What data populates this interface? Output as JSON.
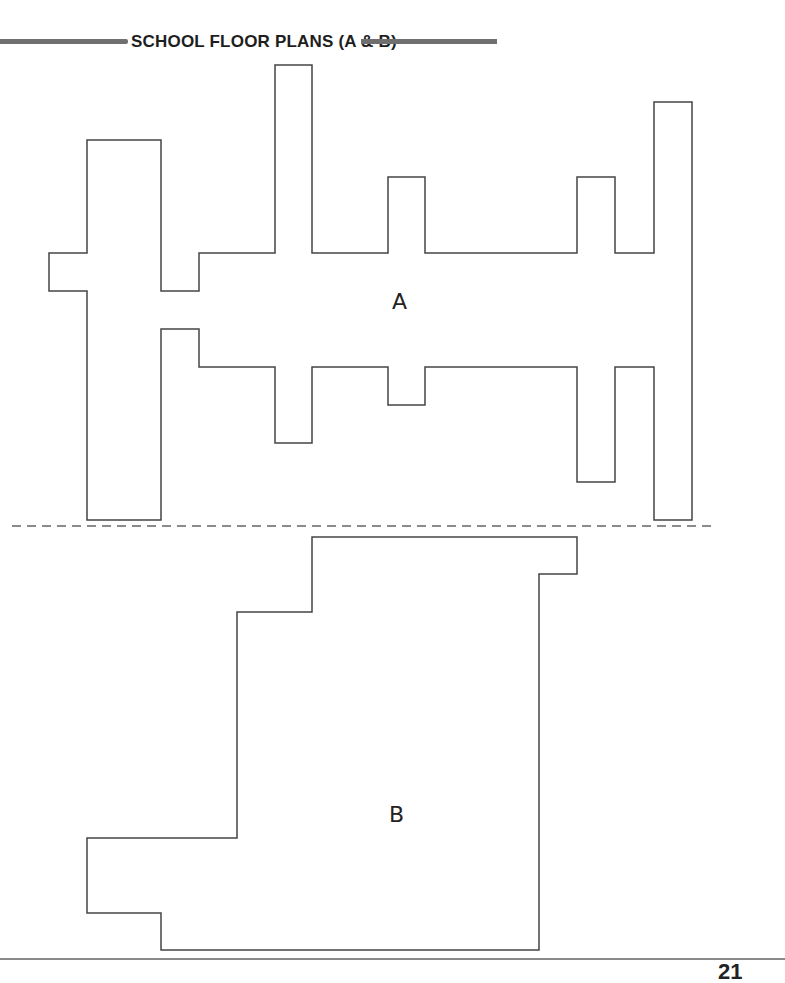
{
  "page": {
    "title": "SCHOOL FLOOR PLANS (A & B)",
    "page_number": "21"
  },
  "colors": {
    "outline": "#444444",
    "header_rule": "#6f6f6f",
    "divider": "#666666",
    "background": "#ffffff"
  },
  "plans": [
    {
      "label": "A",
      "label_position": [
        392,
        291
      ],
      "outline_points": [
        [
          49,
          253
        ],
        [
          87,
          253
        ],
        [
          87,
          140
        ],
        [
          161,
          140
        ],
        [
          161,
          291
        ],
        [
          199,
          291
        ],
        [
          199,
          253
        ],
        [
          275,
          253
        ],
        [
          275,
          65
        ],
        [
          312,
          65
        ],
        [
          312,
          253
        ],
        [
          388,
          253
        ],
        [
          388,
          177
        ],
        [
          425,
          177
        ],
        [
          425,
          253
        ],
        [
          577,
          253
        ],
        [
          577,
          177
        ],
        [
          615,
          177
        ],
        [
          615,
          253
        ],
        [
          654,
          253
        ],
        [
          654,
          102
        ],
        [
          692,
          102
        ],
        [
          692,
          520
        ],
        [
          654,
          520
        ],
        [
          654,
          367
        ],
        [
          615,
          367
        ],
        [
          615,
          482
        ],
        [
          577,
          482
        ],
        [
          577,
          367
        ],
        [
          425,
          367
        ],
        [
          425,
          405
        ],
        [
          388,
          405
        ],
        [
          388,
          367
        ],
        [
          312,
          367
        ],
        [
          312,
          443
        ],
        [
          275,
          443
        ],
        [
          275,
          367
        ],
        [
          199,
          367
        ],
        [
          199,
          329
        ],
        [
          161,
          329
        ],
        [
          161,
          520
        ],
        [
          87,
          520
        ],
        [
          87,
          291
        ],
        [
          49,
          291
        ]
      ]
    },
    {
      "label": "B",
      "label_position": [
        389,
        804
      ],
      "outline_points": [
        [
          312,
          537
        ],
        [
          577,
          537
        ],
        [
          577,
          574
        ],
        [
          539,
          574
        ],
        [
          539,
          950
        ],
        [
          161,
          950
        ],
        [
          161,
          913
        ],
        [
          87,
          913
        ],
        [
          87,
          838
        ],
        [
          237,
          838
        ],
        [
          237,
          612
        ],
        [
          312,
          612
        ]
      ]
    }
  ],
  "divider": {
    "style": "dashed",
    "y": 526,
    "x_start": 12,
    "x_end": 712
  }
}
